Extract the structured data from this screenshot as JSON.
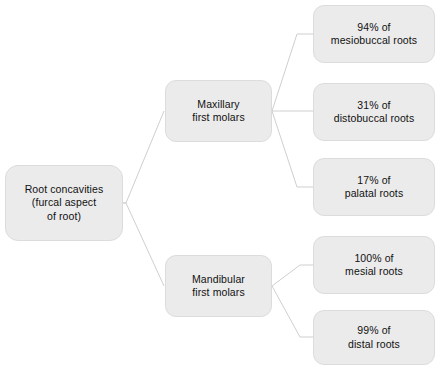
{
  "diagram": {
    "type": "tree",
    "orientation": "left-to-right",
    "colors": {
      "node_fill": "#ebebeb",
      "node_border": "#dcdcdc",
      "connector": "#cfcfcf",
      "text": "#111111",
      "background": "#ffffff"
    },
    "root": {
      "id": "root",
      "line1": "Root concavities",
      "line2": "(furcal aspect",
      "line3": "of root)"
    },
    "branches": [
      {
        "id": "maxillary",
        "line1": "Maxillary",
        "line2": "first molars"
      },
      {
        "id": "mandibular",
        "line1": "Mandibular",
        "line2": "first molars"
      }
    ],
    "leaves": [
      {
        "id": "mesiobuccal",
        "parent": "maxillary",
        "percent": "94% of",
        "label": "mesiobuccal roots"
      },
      {
        "id": "distobuccal",
        "parent": "maxillary",
        "percent": "31% of",
        "label": "distobuccal roots"
      },
      {
        "id": "palatal",
        "parent": "maxillary",
        "percent": "17% of",
        "label": "palatal roots"
      },
      {
        "id": "mesial",
        "parent": "mandibular",
        "percent": "100% of",
        "label": "mesial roots"
      },
      {
        "id": "distal",
        "parent": "mandibular",
        "percent": "99% of",
        "label": "distal roots"
      }
    ]
  }
}
